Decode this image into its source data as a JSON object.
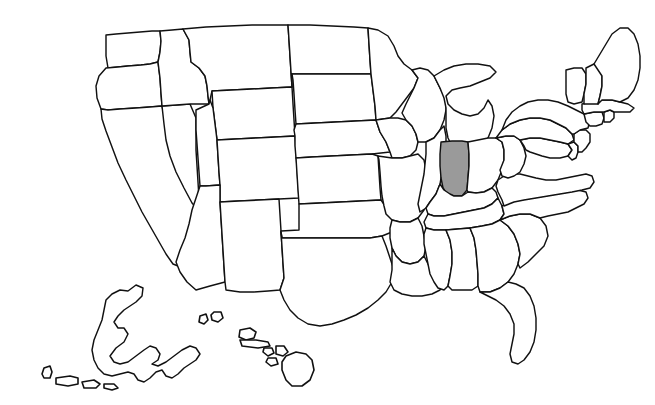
{
  "figure": {
    "background_color": "#ffffff",
    "outline_color": "#111111",
    "highlight_color": "#9a9a9a",
    "width": 655,
    "height": 405
  },
  "map": {
    "projection_note": "Contiguous United States with Alaska and Hawaii insets",
    "highlighted_state": "Indiana",
    "highlighted_state_abbr": "IN",
    "state_count": 50,
    "states": [
      {
        "abbr": "WA",
        "name": "Washington",
        "highlighted": false
      },
      {
        "abbr": "OR",
        "name": "Oregon",
        "highlighted": false
      },
      {
        "abbr": "CA",
        "name": "California",
        "highlighted": false
      },
      {
        "abbr": "NV",
        "name": "Nevada",
        "highlighted": false
      },
      {
        "abbr": "ID",
        "name": "Idaho",
        "highlighted": false
      },
      {
        "abbr": "MT",
        "name": "Montana",
        "highlighted": false
      },
      {
        "abbr": "WY",
        "name": "Wyoming",
        "highlighted": false
      },
      {
        "abbr": "UT",
        "name": "Utah",
        "highlighted": false
      },
      {
        "abbr": "AZ",
        "name": "Arizona",
        "highlighted": false
      },
      {
        "abbr": "NM",
        "name": "New Mexico",
        "highlighted": false
      },
      {
        "abbr": "CO",
        "name": "Colorado",
        "highlighted": false
      },
      {
        "abbr": "ND",
        "name": "North Dakota",
        "highlighted": false
      },
      {
        "abbr": "SD",
        "name": "South Dakota",
        "highlighted": false
      },
      {
        "abbr": "NE",
        "name": "Nebraska",
        "highlighted": false
      },
      {
        "abbr": "KS",
        "name": "Kansas",
        "highlighted": false
      },
      {
        "abbr": "OK",
        "name": "Oklahoma",
        "highlighted": false
      },
      {
        "abbr": "TX",
        "name": "Texas",
        "highlighted": false
      },
      {
        "abbr": "MN",
        "name": "Minnesota",
        "highlighted": false
      },
      {
        "abbr": "IA",
        "name": "Iowa",
        "highlighted": false
      },
      {
        "abbr": "MO",
        "name": "Missouri",
        "highlighted": false
      },
      {
        "abbr": "AR",
        "name": "Arkansas",
        "highlighted": false
      },
      {
        "abbr": "LA",
        "name": "Louisiana",
        "highlighted": false
      },
      {
        "abbr": "WI",
        "name": "Wisconsin",
        "highlighted": false
      },
      {
        "abbr": "IL",
        "name": "Illinois",
        "highlighted": false
      },
      {
        "abbr": "MI",
        "name": "Michigan",
        "highlighted": false
      },
      {
        "abbr": "IN",
        "name": "Indiana",
        "highlighted": true
      },
      {
        "abbr": "OH",
        "name": "Ohio",
        "highlighted": false
      },
      {
        "abbr": "KY",
        "name": "Kentucky",
        "highlighted": false
      },
      {
        "abbr": "TN",
        "name": "Tennessee",
        "highlighted": false
      },
      {
        "abbr": "MS",
        "name": "Mississippi",
        "highlighted": false
      },
      {
        "abbr": "AL",
        "name": "Alabama",
        "highlighted": false
      },
      {
        "abbr": "GA",
        "name": "Georgia",
        "highlighted": false
      },
      {
        "abbr": "FL",
        "name": "Florida",
        "highlighted": false
      },
      {
        "abbr": "SC",
        "name": "South Carolina",
        "highlighted": false
      },
      {
        "abbr": "NC",
        "name": "North Carolina",
        "highlighted": false
      },
      {
        "abbr": "VA",
        "name": "Virginia",
        "highlighted": false
      },
      {
        "abbr": "WV",
        "name": "West Virginia",
        "highlighted": false
      },
      {
        "abbr": "MD",
        "name": "Maryland",
        "highlighted": false
      },
      {
        "abbr": "DE",
        "name": "Delaware",
        "highlighted": false
      },
      {
        "abbr": "PA",
        "name": "Pennsylvania",
        "highlighted": false
      },
      {
        "abbr": "NJ",
        "name": "New Jersey",
        "highlighted": false
      },
      {
        "abbr": "NY",
        "name": "New York",
        "highlighted": false
      },
      {
        "abbr": "CT",
        "name": "Connecticut",
        "highlighted": false
      },
      {
        "abbr": "RI",
        "name": "Rhode Island",
        "highlighted": false
      },
      {
        "abbr": "MA",
        "name": "Massachusetts",
        "highlighted": false
      },
      {
        "abbr": "VT",
        "name": "Vermont",
        "highlighted": false
      },
      {
        "abbr": "NH",
        "name": "New Hampshire",
        "highlighted": false
      },
      {
        "abbr": "ME",
        "name": "Maine",
        "highlighted": false
      },
      {
        "abbr": "AK",
        "name": "Alaska",
        "highlighted": false
      },
      {
        "abbr": "HI",
        "name": "Hawaii",
        "highlighted": false
      }
    ],
    "insets": [
      {
        "name": "Alaska",
        "position": "lower-left"
      },
      {
        "name": "Hawaii",
        "position": "lower-center"
      }
    ]
  }
}
